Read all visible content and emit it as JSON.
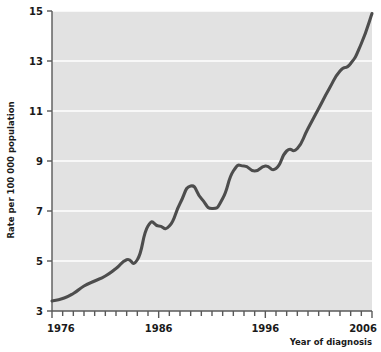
{
  "chart_data": {
    "type": "line",
    "title": "",
    "xlabel": "Year of diagnosis",
    "ylabel": "Rate per 100 000 population",
    "xlim": [
      1976,
      2006
    ],
    "ylim": [
      3,
      15
    ],
    "xticks": [
      1976,
      1986,
      1996,
      2006
    ],
    "xtick_labels": [
      "1976",
      "1986",
      "1996",
      "2006"
    ],
    "xtick_minor_step": 1,
    "yticks": [
      3,
      5,
      7,
      9,
      11,
      13,
      15
    ],
    "ytick_labels": [
      "3",
      "5",
      "7",
      "9",
      "11",
      "13",
      "15"
    ],
    "grid": "horizontal-white-on-gray",
    "legend": "none",
    "series": [
      {
        "name": "Rate per 100 000 population",
        "color": "#4d4d4d",
        "x": [
          1976,
          1977,
          1978,
          1979,
          1980,
          1981,
          1982,
          1983,
          1984,
          1985,
          1986,
          1987,
          1988,
          1989,
          1990,
          1991,
          1992,
          1993,
          1994,
          1995,
          1996,
          1997,
          1998,
          1999,
          2000,
          2001,
          2002,
          2003,
          2004,
          2005,
          2006
        ],
        "values": [
          3.4,
          3.5,
          3.7,
          4.0,
          4.2,
          4.4,
          4.7,
          5.05,
          5.05,
          6.4,
          6.4,
          6.4,
          7.3,
          8.0,
          7.5,
          7.1,
          7.5,
          8.6,
          8.8,
          8.6,
          8.8,
          8.7,
          9.4,
          9.5,
          10.3,
          11.1,
          11.9,
          12.6,
          12.9,
          13.7,
          14.9
        ]
      }
    ]
  },
  "plot": {
    "background_color": "#e2e2e2",
    "gridline_color": "#ffffff",
    "axis_color": "#4d4d4d",
    "line_color": "#4d4d4d",
    "line_width": 3
  }
}
